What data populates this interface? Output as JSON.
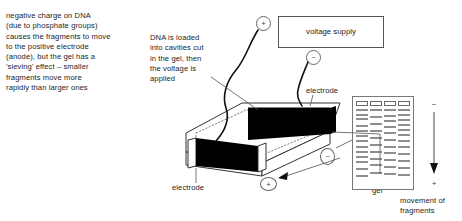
{
  "notes": {
    "left": "negative charge on DNA\n(due to phosphate groups)\ncauses the fragments to move\nto the positive electrode\n(anode), but the gel has a\n'sieving' effect – smaller\nfragments move more\nrapidly than larger ones",
    "loading": "DNA is loaded\ninto cavities cut\nin the gel, then\nthe voltage is\napplied"
  },
  "labels": {
    "electrode_top": "electrode",
    "electrode_bottom": "electrode",
    "agarose_gel": "agarose\ngel",
    "movement": "movement of\nfragments"
  },
  "power_supply": {
    "label": "voltage supply",
    "positive_symbol": "+",
    "negative_symbol": "−"
  },
  "tank_polarity": {
    "negative_symbol": "−",
    "positive_symbol": "+"
  },
  "migration_arrow": {
    "top_symbol": "−",
    "bottom_symbol": "+"
  },
  "colors": {
    "electrode_fill": "#000000",
    "band_fill": "#8f8f8f",
    "outline": "#555555",
    "text": "#1d1d1d"
  },
  "chart_data": {
    "type": "table",
    "xlabel": "lanes",
    "ylabel": "migration distance",
    "categories": [
      "lane 1",
      "lane 2",
      "lane 3",
      "lane 4"
    ],
    "well_count": 4,
    "band_positions_percent": {
      "lane 1": [
        12,
        17,
        22,
        30,
        36,
        42,
        48,
        54,
        60,
        66,
        72,
        80,
        88
      ],
      "lane 2": [
        12,
        20,
        28,
        36,
        44,
        52,
        60,
        68,
        76,
        85
      ],
      "lane 3": [
        12,
        18,
        24,
        31,
        38,
        46,
        54,
        62,
        70,
        78,
        86
      ],
      "lane 4": [
        12,
        17,
        23,
        29,
        35,
        41,
        47,
        55,
        63,
        71,
        79,
        87
      ]
    },
    "legend_position": "none",
    "grid": false
  }
}
